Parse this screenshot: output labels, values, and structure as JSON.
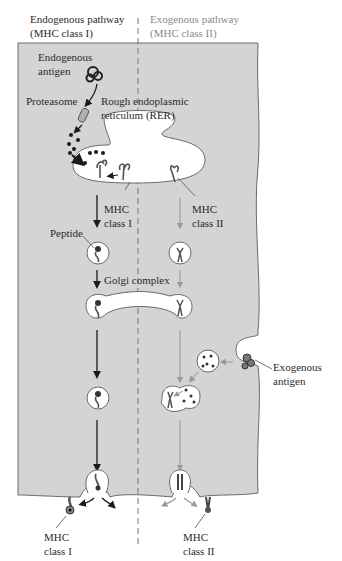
{
  "headers": {
    "endogenous": {
      "line1": "Endogenous pathway",
      "line2": "(MHC class I)"
    },
    "exogenous": {
      "line1": "Exogenous pathway",
      "line2": "(MHC class II)"
    }
  },
  "labels": {
    "endogenous_antigen": {
      "line1": "Endogenous",
      "line2": "antigen"
    },
    "proteasome": "Proteasome",
    "rer": {
      "line1": "Rough endoplasmic",
      "line2": "reticulum (RER)"
    },
    "mhc_class_i_rer": {
      "line1": "MHC",
      "line2": "class I"
    },
    "mhc_class_ii_rer": {
      "line1": "MHC",
      "line2": "class II"
    },
    "peptide": "Peptide",
    "golgi": "Golgi complex",
    "exogenous_antigen": {
      "line1": "Exogenous",
      "line2": "antigen"
    },
    "mhc_class_i_surface": {
      "line1": "MHC",
      "line2": "class I"
    },
    "mhc_class_ii_surface": {
      "line1": "MHC",
      "line2": "class II"
    }
  },
  "colors": {
    "cytoplasm": "#d4d4d4",
    "membrane": "#6a6a6a",
    "organelle": "#ffffff",
    "endogenous_arrow": "#1a1a1a",
    "exogenous_arrow": "#9a9a9a"
  }
}
